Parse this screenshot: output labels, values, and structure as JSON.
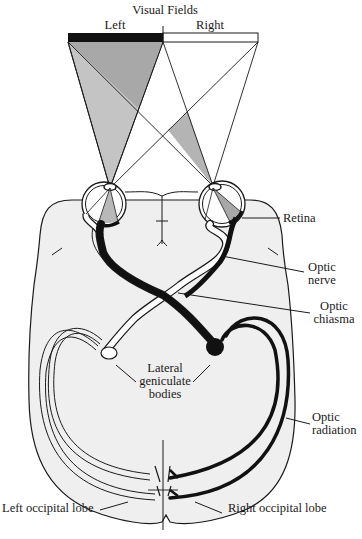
{
  "diagram": {
    "title": "Visual Fields",
    "field_labels": {
      "left": "Left",
      "right": "Right"
    },
    "labels": {
      "retina": "Retina",
      "optic_nerve_1": "Optic",
      "optic_nerve_2": "nerve",
      "optic_chiasma_1": "Optic",
      "optic_chiasma_2": "chiasma",
      "lgb_1": "Lateral",
      "lgb_2": "geniculate",
      "lgb_3": "bodies",
      "optic_radiation_1": "Optic",
      "optic_radiation_2": "radiation",
      "left_occipital": "Left occipital lobe",
      "right_occipital": "Right occipital lobe"
    },
    "colors": {
      "ink": "#1a1a1a",
      "brain_fill": "#efefef",
      "shade_dark": "#a8a8a8",
      "shade_light": "#c4c4c4",
      "paper": "#ffffff"
    }
  }
}
